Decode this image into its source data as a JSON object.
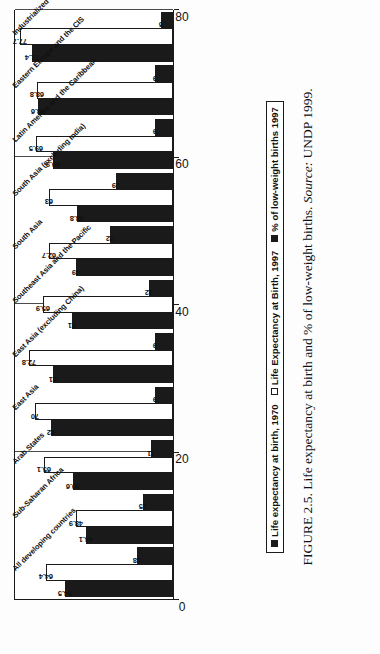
{
  "figure": {
    "caption_label": "FIGURE 2.5.",
    "caption_text": "Life expectancy at birth and % of low-weight births.",
    "source_label": "Source:",
    "source_value": "UNDP 1999."
  },
  "legend": {
    "items": [
      {
        "label": "Life expectancy at birth, 1970",
        "swatch": "black-square-icon",
        "color": "#1a1a1a"
      },
      {
        "label": "Life Expectancy at Birth, 1997",
        "swatch": "white-square-icon",
        "color": "#ffffff"
      },
      {
        "label": "% of low-weight births 1997",
        "swatch": "black-square-icon",
        "color": "#1a1a1a"
      }
    ]
  },
  "axis": {
    "ticks": [
      "0",
      "20",
      "40",
      "60",
      "80"
    ],
    "min": 0,
    "max": 80
  },
  "chart_data": {
    "type": "bar",
    "title": "",
    "subtitle": "",
    "xlabel": "",
    "ylabel": "",
    "ylim": [
      0,
      80
    ],
    "grid": true,
    "orientation": "horizontal",
    "legend_position": "bottom",
    "categories": [
      "All developing countries",
      "Sub-Saharan Africa",
      "Arab States",
      "East Asia",
      "East Asia (excluding China)",
      "Southeast Asia and the Pacific",
      "South Asia",
      "South Asia (excluding India)",
      "Latin America and the Caribbean",
      "Eastern Europe and the CIS",
      "Industrialized countries"
    ],
    "series": [
      {
        "name": "Life expectancy at birth, 1970",
        "color": "#1a1a1a",
        "values": [
          54.5,
          44.1,
          50.6,
          62,
          61,
          51,
          49,
          48.8,
          60.9,
          68.6,
          71.4
        ],
        "labels": [
          "54.5",
          "44.1",
          "50.6",
          "62",
          "61",
          "51",
          "49",
          "48.8",
          "60.9",
          "68.6",
          "71.4"
        ]
      },
      {
        "name": "Life Expectancy at Birth, 1997",
        "color": "#ffffff",
        "values": [
          64.4,
          48.9,
          65.1,
          70,
          72.8,
          65.9,
          62.7,
          63,
          69.5,
          68.8,
          77.7
        ],
        "labels": [
          "64.4",
          "48.9",
          "65.1",
          "70",
          "72.8",
          "65.9",
          "62.7",
          "63",
          "69.5",
          "68.8",
          "77.7"
        ]
      },
      {
        "name": "% of low-weight births 1997",
        "color": "#1a1a1a",
        "values": [
          18,
          15,
          11,
          9,
          9,
          12,
          32,
          29,
          9,
          9,
          6
        ],
        "labels": [
          "18",
          "15",
          "11",
          "9",
          "9",
          "12",
          "32",
          "29",
          "9",
          "9",
          "6"
        ]
      }
    ]
  }
}
